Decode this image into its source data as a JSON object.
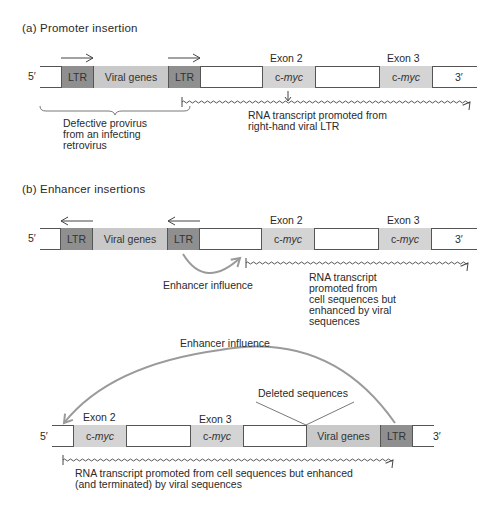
{
  "panel_a": {
    "title": "(a)  Promoter insertion",
    "five_prime": "5′",
    "three_prime": "3′",
    "ltr_left": "LTR",
    "viral_genes": "Viral genes",
    "ltr_right": "LTR",
    "exon2_label": "Exon 2",
    "exon3_label": "Exon 3",
    "exon2_prefix": "c-",
    "exon2_gene": "myc",
    "exon3_prefix": "c-",
    "exon3_gene": "myc",
    "provirus_line1": "Defective provirus",
    "provirus_line2": "from an infecting",
    "provirus_line3": "retrovirus",
    "transcript_line1": "RNA transcript promoted from",
    "transcript_line2": "right-hand viral LTR"
  },
  "panel_b": {
    "title": "(b)  Enhancer insertions",
    "five_prime": "5′",
    "three_prime": "3′",
    "ltr_left": "LTR",
    "viral_genes": "Viral genes",
    "ltr_right": "LTR",
    "exon2_label": "Exon 2",
    "exon3_label": "Exon 3",
    "exon2_prefix": "c-",
    "exon2_gene": "myc",
    "exon3_prefix": "c-",
    "exon3_gene": "myc",
    "enhancer_label": "Enhancer influence",
    "transcript_line1": "RNA transcript",
    "transcript_line2": "promoted from",
    "transcript_line3": "cell sequences but",
    "transcript_line4": "enhanced by viral",
    "transcript_line5": "sequences"
  },
  "panel_c": {
    "enhancer_label": "Enhancer influence",
    "deleted_label": "Deleted sequences",
    "five_prime": "5′",
    "three_prime": "3′",
    "exon2_label": "Exon 2",
    "exon3_label": "Exon 3",
    "exon2_prefix": "c-",
    "exon2_gene": "myc",
    "exon3_prefix": "c-",
    "exon3_gene": "myc",
    "viral_genes": "Viral genes",
    "ltr": "LTR",
    "transcript_line1": "RNA transcript promoted from cell sequences but enhanced",
    "transcript_line2": "(and terminated) by viral sequences"
  },
  "colors": {
    "ltr": "#8f8f8f",
    "viral_genes": "#c9c9c9",
    "exon": "#d4d4d4",
    "enhancer_arrow": "#9a9a9a",
    "line": "#555555"
  }
}
